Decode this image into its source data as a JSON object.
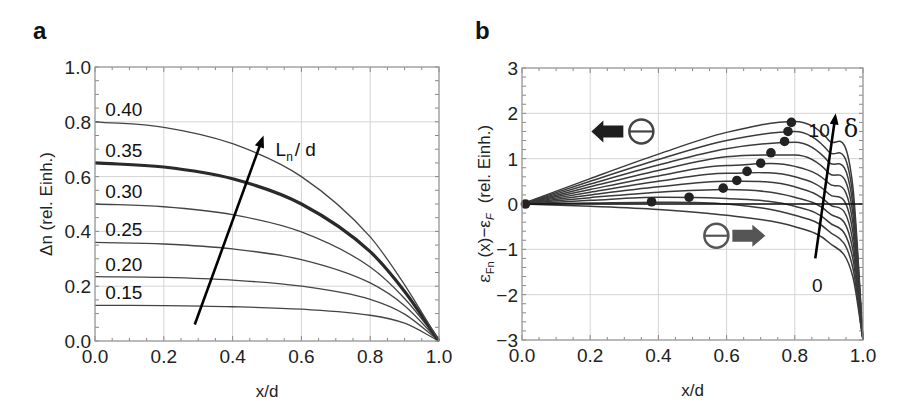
{
  "figure": {
    "panels": [
      {
        "letter": "a"
      },
      {
        "letter": "b"
      }
    ]
  },
  "chart_data": [
    {
      "type": "line",
      "panel": "a",
      "title": "",
      "xlabel": "x/d",
      "ylabel": "Δn (rel. Einh.)",
      "xlim": [
        0.0,
        1.0
      ],
      "ylim": [
        0.0,
        1.0
      ],
      "xticks": [
        "0.0",
        "0.2",
        "0.4",
        "0.6",
        "0.8",
        "1.0"
      ],
      "yticks": [
        "0.0",
        "0.2",
        "0.4",
        "0.6",
        "0.8",
        "1.0"
      ],
      "grid": true,
      "legend": "none (inline curve labels)",
      "annotation": {
        "text": "Ln / d",
        "main": "L",
        "sub": "n",
        "rest": "/ d",
        "arrow_from": [
          0.29,
          0.06
        ],
        "arrow_to": [
          0.49,
          0.75
        ]
      },
      "series": [
        {
          "name": "0.15",
          "label_text": "0.15",
          "highlight": false,
          "x": [
            0.0,
            0.2,
            0.4,
            0.6,
            0.8,
            0.9,
            1.0
          ],
          "values": [
            0.13,
            0.129,
            0.125,
            0.116,
            0.094,
            0.065,
            0.0
          ]
        },
        {
          "name": "0.20",
          "label_text": "0.20",
          "highlight": false,
          "x": [
            0.0,
            0.2,
            0.4,
            0.6,
            0.8,
            0.9,
            1.0
          ],
          "values": [
            0.235,
            0.232,
            0.222,
            0.2,
            0.152,
            0.098,
            0.0
          ]
        },
        {
          "name": "0.25",
          "label_text": "0.25",
          "highlight": false,
          "x": [
            0.0,
            0.2,
            0.4,
            0.6,
            0.8,
            0.9,
            1.0
          ],
          "values": [
            0.36,
            0.354,
            0.336,
            0.297,
            0.212,
            0.129,
            0.0
          ]
        },
        {
          "name": "0.30",
          "label_text": "0.30",
          "highlight": false,
          "x": [
            0.0,
            0.2,
            0.4,
            0.6,
            0.8,
            0.9,
            1.0
          ],
          "values": [
            0.5,
            0.49,
            0.461,
            0.398,
            0.27,
            0.155,
            0.0
          ]
        },
        {
          "name": "0.35",
          "label_text": "0.35",
          "highlight": true,
          "x": [
            0.0,
            0.2,
            0.4,
            0.6,
            0.8,
            0.9,
            1.0
          ],
          "values": [
            0.65,
            0.635,
            0.592,
            0.5,
            0.326,
            0.181,
            0.0
          ]
        },
        {
          "name": "0.40",
          "label_text": "0.40",
          "highlight": false,
          "x": [
            0.0,
            0.2,
            0.4,
            0.6,
            0.8,
            0.9,
            1.0
          ],
          "values": [
            0.8,
            0.78,
            0.72,
            0.6,
            0.38,
            0.205,
            0.0
          ]
        }
      ]
    },
    {
      "type": "line",
      "panel": "b",
      "title": "",
      "xlabel": "x/d",
      "ylabel": "εFn (x)−εF  (rel. Einh.)",
      "ylabel_parts": {
        "eps": "ε",
        "sub_fn": "Fn",
        "mid": "(x)−ε",
        "sub_f": "F",
        "units": "(rel. Einh.)"
      },
      "xlim": [
        0.0,
        1.0
      ],
      "ylim": [
        -3,
        3
      ],
      "xticks": [
        "0.0",
        "0.2",
        "0.4",
        "0.6",
        "0.8",
        "1.0"
      ],
      "yticks": [
        "−3",
        "−2",
        "−1",
        "0",
        "1",
        "2",
        "3"
      ],
      "grid": true,
      "legend": "none",
      "reference_line_y": 0,
      "annotations": [
        {
          "type": "arrow",
          "label_top": "10",
          "label_bottom": "0",
          "symbol": "δ",
          "from": [
            0.86,
            -1.2
          ],
          "to": [
            0.92,
            2.0
          ]
        },
        {
          "type": "electron-left",
          "symbol": "⊖",
          "direction": "left",
          "at": [
            0.35,
            1.6
          ]
        },
        {
          "type": "electron-right",
          "symbol": "⊖",
          "direction": "right",
          "at": [
            0.57,
            -0.7
          ]
        }
      ],
      "series_param": "δ",
      "series": [
        {
          "name": "δ=0",
          "x": [
            0.0,
            0.2,
            0.4,
            0.6,
            0.8,
            0.9,
            0.97,
            1.0
          ],
          "values": [
            0.0,
            -0.05,
            -0.12,
            -0.25,
            -0.5,
            -0.85,
            -1.6,
            -3.0
          ],
          "max_marker": [
            0.01,
            0.0
          ]
        },
        {
          "name": "δ=1",
          "x": [
            0.0,
            0.2,
            0.4,
            0.6,
            0.8,
            0.9,
            0.97,
            1.0
          ],
          "values": [
            0.0,
            0.02,
            0.04,
            0.0,
            -0.25,
            -0.6,
            -1.4,
            -3.0
          ],
          "max_marker": [
            0.38,
            0.05
          ]
        },
        {
          "name": "δ=2",
          "x": [
            0.0,
            0.2,
            0.4,
            0.6,
            0.8,
            0.9,
            0.97,
            1.0
          ],
          "values": [
            0.0,
            0.08,
            0.15,
            0.12,
            -0.05,
            -0.4,
            -1.2,
            -3.0
          ],
          "max_marker": [
            0.49,
            0.15
          ]
        },
        {
          "name": "δ=3",
          "x": [
            0.0,
            0.2,
            0.4,
            0.6,
            0.8,
            0.9,
            0.97,
            1.0
          ],
          "values": [
            0.0,
            0.14,
            0.26,
            0.32,
            0.15,
            -0.2,
            -1.0,
            -3.0
          ],
          "max_marker": [
            0.59,
            0.35
          ]
        },
        {
          "name": "δ=4",
          "x": [
            0.0,
            0.2,
            0.4,
            0.6,
            0.8,
            0.9,
            0.97,
            1.0
          ],
          "values": [
            0.0,
            0.2,
            0.38,
            0.5,
            0.38,
            0.0,
            -0.8,
            -3.0
          ],
          "max_marker": [
            0.63,
            0.52
          ]
        },
        {
          "name": "δ=5",
          "x": [
            0.0,
            0.2,
            0.4,
            0.6,
            0.8,
            0.9,
            0.97,
            1.0
          ],
          "values": [
            0.0,
            0.26,
            0.5,
            0.68,
            0.6,
            0.22,
            -0.6,
            -3.0
          ],
          "max_marker": [
            0.66,
            0.72
          ]
        },
        {
          "name": "δ=6",
          "x": [
            0.0,
            0.2,
            0.4,
            0.6,
            0.8,
            0.9,
            0.97,
            1.0
          ],
          "values": [
            0.0,
            0.32,
            0.62,
            0.85,
            0.83,
            0.45,
            -0.4,
            -3.0
          ],
          "max_marker": [
            0.7,
            0.9
          ]
        },
        {
          "name": "δ=7",
          "x": [
            0.0,
            0.2,
            0.4,
            0.6,
            0.8,
            0.9,
            0.97,
            1.0
          ],
          "values": [
            0.0,
            0.38,
            0.74,
            1.04,
            1.08,
            0.68,
            -0.2,
            -3.0
          ],
          "max_marker": [
            0.73,
            1.13
          ]
        },
        {
          "name": "δ=8",
          "x": [
            0.0,
            0.2,
            0.4,
            0.6,
            0.8,
            0.9,
            0.97,
            1.0
          ],
          "values": [
            0.0,
            0.44,
            0.86,
            1.22,
            1.36,
            0.92,
            0.0,
            -3.0
          ],
          "max_marker": [
            0.77,
            1.38
          ]
        },
        {
          "name": "δ=9",
          "x": [
            0.0,
            0.2,
            0.4,
            0.6,
            0.8,
            0.9,
            0.97,
            1.0
          ],
          "values": [
            0.0,
            0.5,
            0.98,
            1.4,
            1.6,
            1.15,
            0.2,
            -3.0
          ],
          "max_marker": [
            0.78,
            1.6
          ]
        },
        {
          "name": "δ=10",
          "x": [
            0.0,
            0.2,
            0.4,
            0.6,
            0.8,
            0.9,
            0.97,
            1.0
          ],
          "values": [
            0.0,
            0.56,
            1.1,
            1.58,
            1.82,
            1.4,
            0.4,
            -3.0
          ],
          "max_marker": [
            0.79,
            1.8
          ]
        }
      ]
    }
  ]
}
